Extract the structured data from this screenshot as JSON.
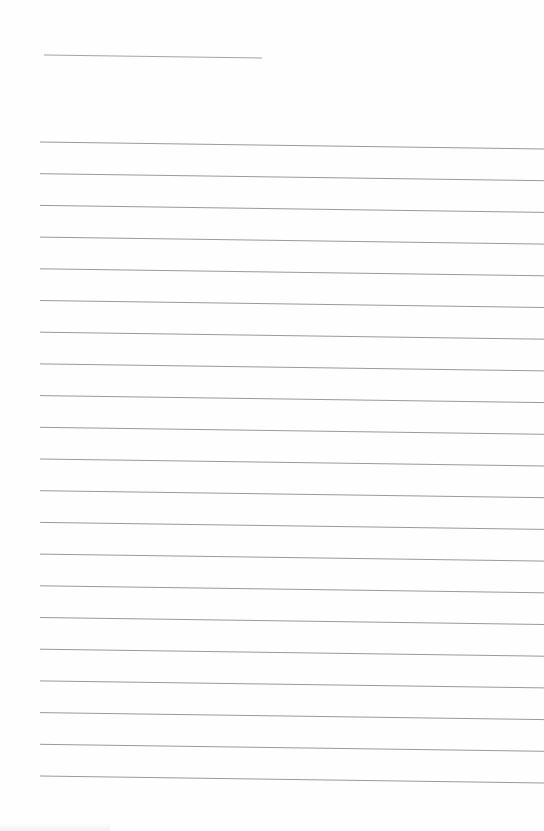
{
  "page": {
    "type": "lined-paper",
    "background_color": "#fefefe",
    "line_color": "#9a9a9a",
    "header_line": {
      "x1": 44,
      "y1": 55,
      "x2": 262,
      "y2": 58
    },
    "ruled_lines": {
      "count": 21,
      "x_start": 40,
      "x_end": 544,
      "first_y_left": 142,
      "spacing": 31.7,
      "right_drop": 7
    },
    "text": []
  }
}
